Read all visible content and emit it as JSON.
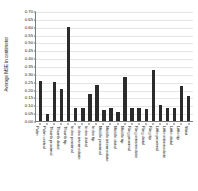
{
  "chart_data": {
    "type": "bar",
    "title": "",
    "xlabel": "",
    "ylabel": "Average MSE in centimeter",
    "ylim": [
      0.0,
      0.7
    ],
    "ytick_labels": [
      "0.70",
      "0.65",
      "0.60",
      "0.55",
      "0.50",
      "0.45",
      "0.40",
      "0.35",
      "0.30",
      "0.25",
      "0.20",
      "0.15",
      "0.10",
      "0.05",
      "0.00"
    ],
    "ytick_values": [
      0.7,
      0.65,
      0.6,
      0.55,
      0.5,
      0.45,
      0.4,
      0.35,
      0.3,
      0.25,
      0.2,
      0.15,
      0.1,
      0.05,
      0.0
    ],
    "grid": true,
    "legend": "none",
    "bar_color": "#2b2b2b",
    "categories": [
      "Palm",
      "Palm central",
      "Thumb proximal",
      "Thumb distal",
      "Thumb tip",
      "Index proximal",
      "Index intermediate",
      "Index distal",
      "Index tip",
      "Middle proximal",
      "Middle intermediate",
      "Middle distal",
      "Middle tip",
      "Ring proximal",
      "Ring intermediate",
      "Ring distal",
      "Ring tip",
      "Little proximal",
      "Little intermediate",
      "Little distal",
      "Little tip",
      "Wrist"
    ],
    "values": [
      0.255,
      0.045,
      0.25,
      0.205,
      0.6,
      0.085,
      0.085,
      0.175,
      0.23,
      0.07,
      0.085,
      0.06,
      0.28,
      0.085,
      0.085,
      0.075,
      0.325,
      0.105,
      0.085,
      0.085,
      0.22,
      0.16
    ]
  }
}
